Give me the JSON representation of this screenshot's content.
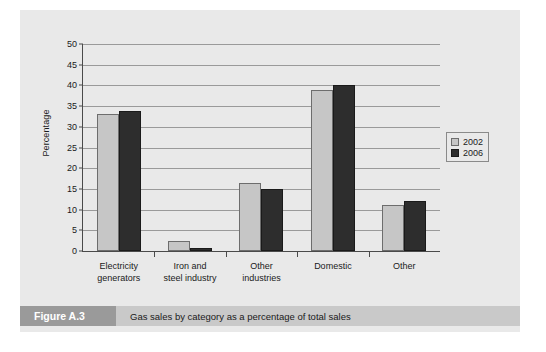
{
  "figure": {
    "tag": "Figure A.3",
    "caption": "Gas sales by category as a percentage of total sales",
    "tag_bg": "#9a9a9a",
    "caption_bg": "#c9c9c9",
    "panel_bg": "#e9e9e9"
  },
  "chart_data": {
    "type": "bar",
    "title": "",
    "xlabel": "",
    "ylabel": "Percentage",
    "ylim": [
      0,
      50
    ],
    "yticks": [
      0,
      5,
      10,
      15,
      20,
      25,
      30,
      35,
      40,
      45,
      50
    ],
    "grid": true,
    "legend_position": "right",
    "categories": [
      "Electricity generators",
      "Iron and steel industry",
      "Other industries",
      "Domestic",
      "Other"
    ],
    "category_lines": [
      [
        "Electricity",
        "generators"
      ],
      [
        "Iron and",
        "steel industry"
      ],
      [
        "Other",
        "industries"
      ],
      [
        "Domestic"
      ],
      [
        "Other"
      ]
    ],
    "series": [
      {
        "name": "2002",
        "color": "#c6c6c6",
        "values": [
          33,
          2.5,
          16.5,
          39,
          11
        ]
      },
      {
        "name": "2006",
        "color": "#2d2d2d",
        "values": [
          33.7,
          0.7,
          15,
          40.2,
          12
        ]
      }
    ]
  }
}
